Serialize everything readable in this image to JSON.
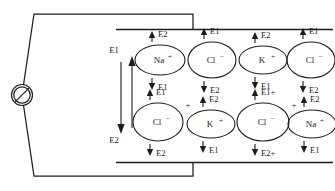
{
  "figure": {
    "background_color": "#ffffff",
    "line_color": "#1d1d1d"
  },
  "circuit": {
    "source": {
      "name": "slashed-circle-source",
      "label": ""
    },
    "top_electrode": {
      "label": ""
    },
    "bottom_electrode": {
      "label": ""
    }
  },
  "field_indicator": {
    "top_label": "E1",
    "bottom_label": "E2",
    "down_arrow_name": "field-arrow-down",
    "up_arrow_name": "field-arrow-up"
  },
  "ions": [
    {
      "id": "ion-r1-c1",
      "species": "Na",
      "charge": "+",
      "external_sign": "",
      "up_label": "E2",
      "down_label": "E1",
      "row": 1,
      "col": 1,
      "cx": 160,
      "cy": 60,
      "rx": 25,
      "ry": 15
    },
    {
      "id": "ion-r1-c2",
      "species": "Cl",
      "charge": "−",
      "external_sign": "",
      "up_label": "E1",
      "down_label": "E2",
      "row": 1,
      "col": 2,
      "cx": 212,
      "cy": 60,
      "rx": 24,
      "ry": 18
    },
    {
      "id": "ion-r1-c3",
      "species": "K",
      "charge": "+",
      "external_sign": "",
      "up_label": "E2",
      "down_label": "E1",
      "row": 1,
      "col": 3,
      "cx": 263,
      "cy": 60,
      "rx": 24,
      "ry": 14
    },
    {
      "id": "ion-r1-c4",
      "species": "Cl",
      "charge": "−",
      "external_sign": "",
      "up_label": "E1",
      "down_label": "E2",
      "row": 1,
      "col": 4,
      "cx": 311,
      "cy": 60,
      "rx": 24,
      "ry": 18
    },
    {
      "id": "ion-r2-c1",
      "species": "Cl",
      "charge": "−",
      "external_sign": "+",
      "up_label": "E1",
      "down_label": "E2",
      "row": 2,
      "col": 1,
      "cx": 158,
      "cy": 122,
      "rx": 25,
      "ry": 19
    },
    {
      "id": "ion-r2-c2",
      "species": "K",
      "charge": "+",
      "external_sign": "",
      "up_label": "E2",
      "down_label": "E1",
      "row": 2,
      "col": 2,
      "cx": 211,
      "cy": 124,
      "rx": 24,
      "ry": 14
    },
    {
      "id": "ion-r2-c3",
      "species": "Cl",
      "charge": "−",
      "external_sign": "+",
      "up_label": "E1+",
      "down_label": "E2+",
      "row": 2,
      "col": 3,
      "cx": 263,
      "cy": 122,
      "rx": 26,
      "ry": 19
    },
    {
      "id": "ion-r2-c4",
      "species": "Na",
      "charge": "+",
      "external_sign": "",
      "up_label": "E2",
      "down_label": "E1",
      "row": 2,
      "col": 4,
      "cx": 312,
      "cy": 124,
      "rx": 24,
      "ry": 14
    }
  ]
}
